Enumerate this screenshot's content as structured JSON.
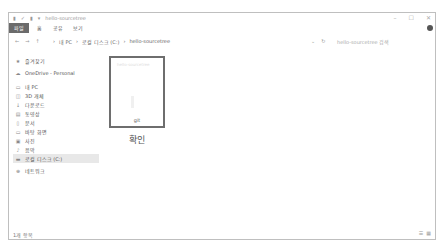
{
  "window": {
    "title": "hello-sourcetree",
    "controls": {
      "minimize": "–",
      "maximize": "☐",
      "close": "✕"
    }
  },
  "quick_access": [
    "▮",
    "✓",
    "▮",
    "▾"
  ],
  "ribbon": {
    "tabs": [
      "파일",
      "홈",
      "공유",
      "보기"
    ]
  },
  "address": {
    "back": "←",
    "forward": "→",
    "up": "↑",
    "path": [
      "›",
      "내 PC",
      "›",
      "로컬 디스크 (C:)",
      "›",
      "hello-sourcetree"
    ],
    "dropdown": "⌄",
    "refresh": "↻",
    "search_placeholder": "hello-sourcetree 검색"
  },
  "sidebar": {
    "items": [
      {
        "icon": "★",
        "label": "즐겨찾기"
      },
      {
        "icon": "☁",
        "label": "OneDrive - Personal"
      },
      {
        "icon": "▭",
        "label": "내 PC"
      },
      {
        "icon": "◫",
        "label": "3D 개체"
      },
      {
        "icon": "↓",
        "label": "다운로드"
      },
      {
        "icon": "▤",
        "label": "동영상"
      },
      {
        "icon": "▯",
        "label": "문서"
      },
      {
        "icon": "▭",
        "label": "바탕 화면"
      },
      {
        "icon": "▣",
        "label": "사진"
      },
      {
        "icon": "♪",
        "label": "음악"
      },
      {
        "icon": "▬",
        "label": "로컬 디스크 (C:)"
      },
      {
        "icon": "⊕",
        "label": "네트워크"
      }
    ]
  },
  "content": {
    "item": {
      "thumbnail_label": "git",
      "thumbnail_title": "hello-sourcetree",
      "caption": "확인"
    }
  },
  "status": {
    "count": "1개 항목",
    "view_details": "☰",
    "view_icons": "▦"
  }
}
